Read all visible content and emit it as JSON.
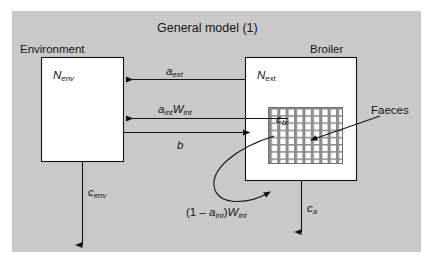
{
  "figure": {
    "title": "General model (1)",
    "panel_color": "#c9c9c9",
    "box_fill": "#ffffff",
    "line_color": "#141414"
  },
  "boxes": [
    {
      "id": "environment",
      "caption": "Environment",
      "symbol": "N",
      "symbol_sub": "env"
    },
    {
      "id": "broiler",
      "caption": "Broiler",
      "symbol": "N",
      "symbol_sub": "ext"
    }
  ],
  "inner_block": {
    "id": "faeces-block",
    "symbol": "c",
    "symbol_sub": "br",
    "pattern": "cross-hatch-grid"
  },
  "callout": {
    "label": "Faeces"
  },
  "flows": [
    {
      "id": "a-ext",
      "symbol": "a",
      "symbol_sub": "ext",
      "direction": "broiler-to-environment"
    },
    {
      "id": "a-int-w-int",
      "symbol": "a",
      "symbol_sub": "int",
      "symbol2": "W",
      "symbol2_sub": "int",
      "direction": "broiler-to-environment"
    },
    {
      "id": "b",
      "symbol": "b",
      "direction": "environment-to-broiler"
    },
    {
      "id": "c-env",
      "symbol": "c",
      "symbol_sub": "env",
      "direction": "environment-down"
    },
    {
      "id": "c-a",
      "symbol": "c",
      "symbol_sub": "a",
      "direction": "broiler-down"
    },
    {
      "id": "one-minus-a-int-w-int",
      "prefix": "(1 – ",
      "symbol": "a",
      "symbol_sub": "int",
      "middle": ")",
      "symbol2": "W",
      "symbol2_sub": "int",
      "direction": "faeces-curve-to-broiler"
    }
  ]
}
